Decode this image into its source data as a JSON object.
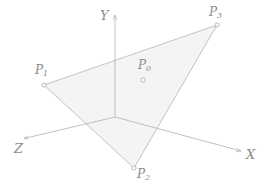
{
  "figure": {
    "background_color": "#ffffff",
    "line_color": "#b0b0b0",
    "label_color": "#8c8c8c",
    "triangle_fill_color": "#f4f4f4",
    "marker_fill_color": "#ffffff"
  },
  "axes": {
    "origin": {
      "x": 115,
      "y": 117
    },
    "items": [
      {
        "name": "Y",
        "label": "Y",
        "tip": {
          "x": 115,
          "y": 13
        }
      },
      {
        "name": "X",
        "label": "X",
        "tip": {
          "x": 243,
          "y": 152
        }
      },
      {
        "name": "Z",
        "label": "Z",
        "tip": {
          "x": 22,
          "y": 139
        }
      }
    ]
  },
  "points": [
    {
      "name": "P1",
      "label": "P",
      "sub": "1",
      "x": 44,
      "y": 85
    },
    {
      "name": "P2",
      "label": "P",
      "sub": "2",
      "x": 134,
      "y": 168
    },
    {
      "name": "P3",
      "label": "P",
      "sub": "3",
      "x": 217,
      "y": 25
    },
    {
      "name": "P0",
      "label": "P",
      "sub": "0",
      "x": 143,
      "y": 80
    }
  ],
  "triangle": {
    "vertices": [
      "P1",
      "P2",
      "P3"
    ],
    "path": "M44,85 L134,168 L217,25 Z"
  }
}
